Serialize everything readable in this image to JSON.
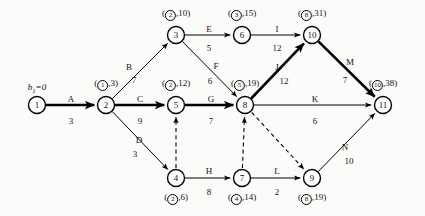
{
  "diagram": {
    "source_label": "b",
    "source_sub": "1",
    "source_value": "=0",
    "colors": {
      "stroke": "#000000",
      "background": "#fbfbf9",
      "node_fill": "#ffffff"
    }
  },
  "nodes": [
    {
      "id": "1",
      "num": "1",
      "x": 37,
      "y": 105,
      "tag_circled": "",
      "tag_value": "",
      "tag_pos": "none"
    },
    {
      "id": "2",
      "num": "2",
      "x": 106,
      "y": 105,
      "tag_circled": "1",
      "tag_value": "3",
      "tag_pos": "above"
    },
    {
      "id": "3",
      "num": "3",
      "x": 176,
      "y": 35,
      "tag_circled": "2",
      "tag_value": "10",
      "tag_pos": "above"
    },
    {
      "id": "4",
      "num": "4",
      "x": 176,
      "y": 178,
      "tag_circled": "2",
      "tag_value": "6",
      "tag_pos": "below"
    },
    {
      "id": "5",
      "num": "5",
      "x": 176,
      "y": 105,
      "tag_circled": "2",
      "tag_value": "12",
      "tag_pos": "above"
    },
    {
      "id": "6",
      "num": "6",
      "x": 242,
      "y": 35,
      "tag_circled": "3",
      "tag_value": "15",
      "tag_pos": "above"
    },
    {
      "id": "7",
      "num": "7",
      "x": 242,
      "y": 178,
      "tag_circled": "4",
      "tag_value": "14",
      "tag_pos": "below"
    },
    {
      "id": "8",
      "num": "8",
      "x": 245,
      "y": 105,
      "tag_circled": "5",
      "tag_value": "19",
      "tag_pos": "above"
    },
    {
      "id": "9",
      "num": "9",
      "x": 312,
      "y": 178,
      "tag_circled": "8",
      "tag_value": "19",
      "tag_pos": "below"
    },
    {
      "id": "10",
      "num": "10",
      "x": 312,
      "y": 35,
      "tag_circled": "8",
      "tag_value": "31",
      "tag_pos": "above"
    },
    {
      "id": "11",
      "num": "11",
      "x": 383,
      "y": 105,
      "tag_circled": "10",
      "tag_value": "38",
      "tag_pos": "above"
    }
  ],
  "edges": [
    {
      "id": "A",
      "name": "A",
      "weight": "3",
      "from": "1",
      "to": "2",
      "style": "bold"
    },
    {
      "id": "B",
      "name": "B",
      "weight": "7",
      "from": "2",
      "to": "3",
      "style": "plain"
    },
    {
      "id": "C",
      "name": "C",
      "weight": "9",
      "from": "2",
      "to": "5",
      "style": "bold"
    },
    {
      "id": "D",
      "name": "D",
      "weight": "3",
      "from": "2",
      "to": "4",
      "style": "plain"
    },
    {
      "id": "E",
      "name": "E",
      "weight": "5",
      "from": "3",
      "to": "6",
      "style": "plain"
    },
    {
      "id": "F",
      "name": "F",
      "weight": "6",
      "from": "3",
      "to": "8",
      "style": "plain"
    },
    {
      "id": "G",
      "name": "G",
      "weight": "7",
      "from": "5",
      "to": "8",
      "style": "bold"
    },
    {
      "id": "H",
      "name": "H",
      "weight": "8",
      "from": "4",
      "to": "7",
      "style": "plain"
    },
    {
      "id": "I",
      "name": "I",
      "weight": "12",
      "from": "6",
      "to": "10",
      "style": "plain"
    },
    {
      "id": "J",
      "name": "J",
      "weight": "12",
      "from": "8",
      "to": "10",
      "style": "bold"
    },
    {
      "id": "K",
      "name": "K",
      "weight": "6",
      "from": "8",
      "to": "11",
      "style": "plain"
    },
    {
      "id": "L",
      "name": "L",
      "weight": "2",
      "from": "7",
      "to": "9",
      "style": "plain"
    },
    {
      "id": "M",
      "name": "M",
      "weight": "7",
      "from": "10",
      "to": "11",
      "style": "bold"
    },
    {
      "id": "N",
      "name": "N",
      "weight": "10",
      "from": "9",
      "to": "11",
      "style": "plain"
    }
  ],
  "dummy_edges": [
    {
      "id": "d45",
      "from": "4",
      "to": "5",
      "style": "dashed"
    },
    {
      "id": "d78",
      "from": "7",
      "to": "8",
      "style": "dashed"
    },
    {
      "id": "d89",
      "from": "8",
      "to": "9",
      "style": "dashed"
    }
  ],
  "edge_labels": [
    {
      "id": "A",
      "name": "A",
      "nx": 71,
      "ny": 95,
      "weight": "3",
      "wx": 71,
      "wy": 117
    },
    {
      "id": "B",
      "name": "B",
      "nx": 129,
      "ny": 63,
      "weight": "7",
      "wx": 134,
      "wy": 76
    },
    {
      "id": "C",
      "name": "C",
      "nx": 140,
      "ny": 95,
      "weight": "9",
      "wx": 140,
      "wy": 117
    },
    {
      "id": "D",
      "name": "D",
      "nx": 139,
      "ny": 136,
      "weight": "3",
      "wx": 135,
      "wy": 150
    },
    {
      "id": "E",
      "name": "E",
      "nx": 209,
      "ny": 25,
      "weight": "5",
      "wx": 209,
      "wy": 44
    },
    {
      "id": "F",
      "name": "F",
      "nx": 216,
      "ny": 62,
      "weight": "6",
      "wx": 210,
      "wy": 77
    },
    {
      "id": "G",
      "name": "G",
      "nx": 211,
      "ny": 95,
      "weight": "7",
      "wx": 211,
      "wy": 117
    },
    {
      "id": "H",
      "name": "H",
      "nx": 209,
      "ny": 167,
      "weight": "8",
      "wx": 209,
      "wy": 188
    },
    {
      "id": "I",
      "name": "I",
      "nx": 277,
      "ny": 25,
      "weight": "12",
      "wx": 277,
      "wy": 44
    },
    {
      "id": "J",
      "name": "J",
      "nx": 277,
      "ny": 63,
      "weight": "12",
      "wx": 284,
      "wy": 77
    },
    {
      "id": "K",
      "name": "K",
      "nx": 315,
      "ny": 95,
      "weight": "6",
      "wx": 315,
      "wy": 117
    },
    {
      "id": "L",
      "name": "L",
      "nx": 277,
      "ny": 167,
      "weight": "2",
      "wx": 277,
      "wy": 188
    },
    {
      "id": "M",
      "name": "M",
      "nx": 350,
      "ny": 58,
      "weight": "7",
      "wx": 345,
      "wy": 76
    },
    {
      "id": "N",
      "name": "N",
      "nx": 345,
      "ny": 143,
      "weight": "10",
      "wx": 349,
      "wy": 157
    }
  ]
}
